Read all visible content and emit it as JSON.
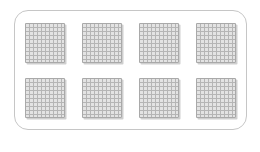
{
  "canvas": {
    "width": 260,
    "height": 152,
    "background_color": "#ffffff"
  },
  "frame": {
    "border_color": "#c6c6c6",
    "corner_radius": 14
  },
  "blocks": {
    "icon_name": "hundred-flat-grid-icon",
    "description_visible_content": "eight identical gray square grids",
    "rows": 2,
    "columns": 4,
    "count": 8,
    "cells_per_side": 10,
    "fill_color": "#e3e3e3",
    "grid_line_color": "#b5b5b5",
    "edge_color": "#a9a9a9",
    "shadow_color": "#cfcfcf"
  }
}
